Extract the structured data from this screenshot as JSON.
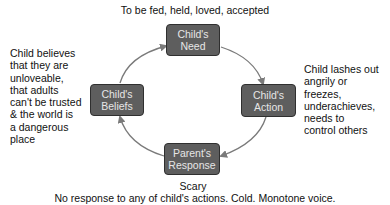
{
  "top_caption": "To be fed, held, loved, accepted",
  "nodes": {
    "need": {
      "line1": "Child's",
      "line2": "Need"
    },
    "action": {
      "line1": "Child's",
      "line2": "Action"
    },
    "response": {
      "line1": "Parent's",
      "line2": "Response"
    },
    "beliefs": {
      "line1": "Child's",
      "line2": "Beliefs"
    }
  },
  "left_caption": [
    "Child believes",
    "that they are",
    "unloveable,",
    "that adults",
    "can't be trusted",
    "& the world is",
    "a dangerous",
    "place"
  ],
  "right_caption": [
    "Child lashes out",
    "angrily or",
    "freezes,",
    "underachieves,",
    "needs to",
    "control others"
  ],
  "bottom_caption": {
    "title": "Scary",
    "detail": "No response to any of child's actions. Cold. Monotone voice."
  },
  "colors": {
    "box_fill": "#5e5e5e",
    "box_border": "#2f2f2f",
    "box_text": "#e6e6e6",
    "arrow": "#7a7a7a"
  }
}
